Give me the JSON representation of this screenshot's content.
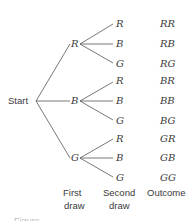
{
  "diagram": {
    "type": "tree diagram",
    "root": "Start",
    "first_draw": [
      "R",
      "B",
      "G"
    ],
    "second_draw": [
      "R",
      "B",
      "G"
    ],
    "outcomes": [
      "RR",
      "RB",
      "RG",
      "BR",
      "BB",
      "BG",
      "GR",
      "GB",
      "GG"
    ],
    "column_labels": {
      "first": [
        "First",
        "draw"
      ],
      "second": [
        "Second",
        "draw"
      ],
      "outcome": "Outcome"
    },
    "caption_clipped": "Figure"
  }
}
